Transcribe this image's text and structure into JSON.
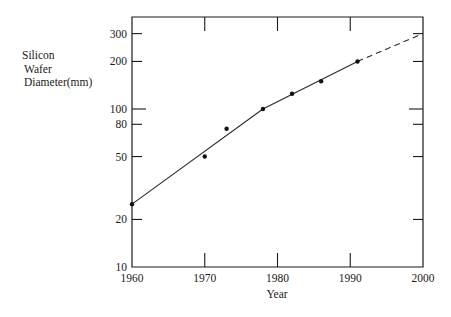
{
  "chart_data": {
    "type": "line",
    "title": "",
    "xlabel": "Year",
    "ylabel": "Silicon Wafer Diameter(mm)",
    "ylabel_lines": [
      "Silicon",
      "Wafer",
      "Diameter(mm)"
    ],
    "x_ticks": [
      1960,
      1970,
      1980,
      1990,
      2000
    ],
    "y_ticks": [
      10,
      20,
      50,
      80,
      100,
      200,
      300
    ],
    "y_scale": "log",
    "xlim": [
      1960,
      2000
    ],
    "ylim": [
      10,
      360
    ],
    "grid": false,
    "legend": null,
    "series": [
      {
        "name": "Measured wafer diameters",
        "style": "scatter",
        "x": [
          1960,
          1970,
          1973,
          1978,
          1982,
          1986,
          1991
        ],
        "y": [
          25,
          50,
          75,
          100,
          125,
          150,
          200
        ]
      },
      {
        "name": "Trend (solid)",
        "style": "solid-line",
        "x": [
          1960,
          1978,
          1991
        ],
        "y": [
          25,
          100,
          200
        ]
      },
      {
        "name": "Projection (dashed)",
        "style": "dashed-line",
        "x": [
          1991,
          2000
        ],
        "y": [
          200,
          300
        ]
      }
    ]
  },
  "labels": {
    "xlabel": "Year",
    "ylabel_lines": [
      "Silicon",
      "Wafer",
      "Diameter(mm)"
    ],
    "x_ticks": [
      "1960",
      "1970",
      "1980",
      "1990",
      "2000"
    ],
    "y_ticks": [
      "10",
      "20",
      "50",
      "80",
      "100",
      "200",
      "300"
    ]
  }
}
